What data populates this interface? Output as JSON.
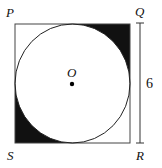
{
  "diagram": {
    "type": "geometry",
    "vertices": {
      "top_left": "P",
      "top_right": "Q",
      "bottom_right": "R",
      "bottom_left": "S"
    },
    "center_label": "O",
    "side_length_label": "6",
    "shaded_regions": [
      "top-right corner",
      "bottom-left corner"
    ],
    "colors": {
      "stroke": "#333333",
      "shade": "#111111",
      "background": "#ffffff"
    }
  }
}
